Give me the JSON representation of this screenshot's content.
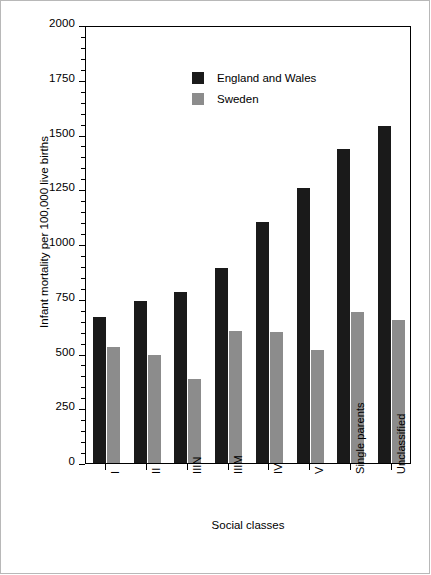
{
  "chart_data": {
    "type": "bar",
    "title": "",
    "xlabel": "Social classes",
    "ylabel": "Infant mortality per 100,000 live births",
    "ylim": [
      0,
      2000
    ],
    "ytick_step": 250,
    "yticks": [
      0,
      250,
      500,
      750,
      1000,
      1250,
      1500,
      1750,
      2000
    ],
    "ytick_labels": [
      "0",
      "250",
      "500",
      "750",
      "1000",
      "1250",
      "1500",
      "1750",
      "2000"
    ],
    "yticks_minor_step": 50,
    "grid": false,
    "legend_position": "upper left",
    "categories": [
      "I",
      "II",
      "IIIN",
      "IIIM",
      "IV",
      "V",
      "Single parents",
      "Unclassified"
    ],
    "series": [
      {
        "name": "England and Wales",
        "color": "#1a1a1a",
        "values": [
          665,
          740,
          780,
          890,
          1100,
          1255,
          1435,
          1540
        ]
      },
      {
        "name": "Sweden",
        "color": "#8c8c8c",
        "values": [
          530,
          495,
          385,
          605,
          600,
          515,
          690,
          655
        ]
      }
    ]
  },
  "figure": {
    "background_color": "#ffffff",
    "axis_color": "#000000",
    "border_color": "#b8b8b8"
  }
}
